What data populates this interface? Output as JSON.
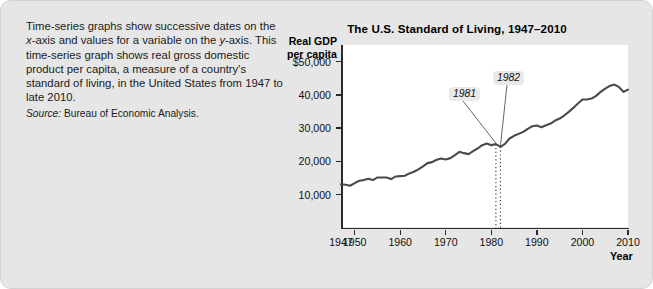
{
  "caption": {
    "text_segments": [
      "Time-series graphs show successive dates on the ",
      "x",
      "-axis and values for a variable on the ",
      "y",
      "-axis. This time-series graph shows real gross domestic product per capita, a measure of a country's standard of living, in the United States from 1947 to late 2010."
    ],
    "source_label": "Source:",
    "source_text": "Bureau of Economic Analysis."
  },
  "chart_data": {
    "type": "line",
    "title": "The U.S. Standard of Living, 1947–2010",
    "ylabel": "Real GDP per capita",
    "ylabel_line1": "Real GDP",
    "ylabel_line2": "per capita",
    "xlabel": "Year",
    "xlim": [
      1947,
      2010
    ],
    "ylim": [
      0,
      55000
    ],
    "grid": false,
    "legend": "none",
    "ytick_labels": [
      "$50,000",
      "40,000",
      "30,000",
      "20,000",
      "10,000"
    ],
    "ytick_values": [
      50000,
      40000,
      30000,
      20000,
      10000
    ],
    "xtick_labels": [
      "1947",
      "1950",
      "1960",
      "1970",
      "1980",
      "1990",
      "2000",
      "2010"
    ],
    "xtick_values": [
      1947,
      1950,
      1960,
      1970,
      1980,
      1990,
      2000,
      2010
    ],
    "line_color": "#4a4a4a",
    "x": [
      1947,
      1948,
      1949,
      1950,
      1951,
      1952,
      1953,
      1954,
      1955,
      1956,
      1957,
      1958,
      1959,
      1960,
      1961,
      1962,
      1963,
      1964,
      1965,
      1966,
      1967,
      1968,
      1969,
      1970,
      1971,
      1972,
      1973,
      1974,
      1975,
      1976,
      1977,
      1978,
      1979,
      1980,
      1981,
      1982,
      1983,
      1984,
      1985,
      1986,
      1987,
      1988,
      1989,
      1990,
      1991,
      1992,
      1993,
      1994,
      1995,
      1996,
      1997,
      1998,
      1999,
      2000,
      2001,
      2002,
      2003,
      2004,
      2005,
      2006,
      2007,
      2008,
      2009,
      2010
    ],
    "values": [
      13100,
      13000,
      12700,
      13500,
      14200,
      14400,
      14800,
      14400,
      15200,
      15200,
      15200,
      14700,
      15500,
      15600,
      15700,
      16400,
      16900,
      17600,
      18500,
      19500,
      19800,
      20500,
      20900,
      20600,
      21000,
      21900,
      22900,
      22500,
      22200,
      23100,
      23900,
      24900,
      25400,
      24900,
      25200,
      24400,
      25300,
      26900,
      27700,
      28300,
      28900,
      29800,
      30600,
      30800,
      30300,
      30900,
      31400,
      32300,
      32900,
      33800,
      34900,
      36100,
      37400,
      38600,
      38600,
      38900,
      39700,
      40900,
      41900,
      42700,
      43100,
      42400,
      40900,
      41600
    ]
  },
  "annotations": [
    {
      "label": "1981",
      "year": 1981
    },
    {
      "label": "1982",
      "year": 1982
    }
  ]
}
